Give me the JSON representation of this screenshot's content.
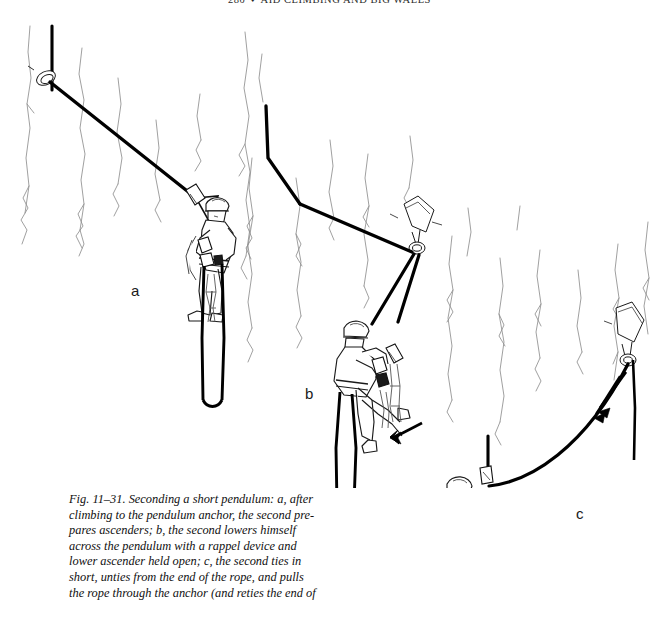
{
  "page": {
    "background_color": "#ffffff",
    "ink_color": "#111111",
    "rock_line_color": "#8c8c8c",
    "rope_color": "#000000"
  },
  "running_head": {
    "page_number": "280",
    "separator": "♦",
    "title": "AID CLIMBING AND BIG WALLS"
  },
  "figure": {
    "number": "Fig. 11–31.",
    "caption_full": "Fig. 11–31. Seconding a short pendulum: a, after climbing to the pendulum anchor, the second prepares ascenders; b, the second lowers himself across the pendulum with a rappel device and lower ascender held open; c, the second ties in short, unties from the end of the rope, and pulls the rope through the anchor (and reties the end of",
    "caption_lines": [
      "Fig. 11–31. Seconding a short pendulum: a, after",
      "climbing to the pendulum anchor, the second pre-",
      "pares ascenders; b, the second lowers himself",
      "across the pendulum with a rappel device and",
      "lower ascender held open; c, the second ties in",
      "short, unties from the end of the rope, and pulls",
      "the rope through the anchor (and reties the end of"
    ],
    "panels": [
      {
        "id": "a",
        "label": "a",
        "description": "Climber hanging at the pendulum anchor preparing ascenders"
      },
      {
        "id": "b",
        "label": "b",
        "description": "Climber lowering across the pendulum with rappel device, motion arrow pointing left-down"
      },
      {
        "id": "c",
        "label": "c",
        "description": "Climber tied in short with rope pulled through the far anchor, arrow pointing down-left along the rope"
      }
    ]
  }
}
